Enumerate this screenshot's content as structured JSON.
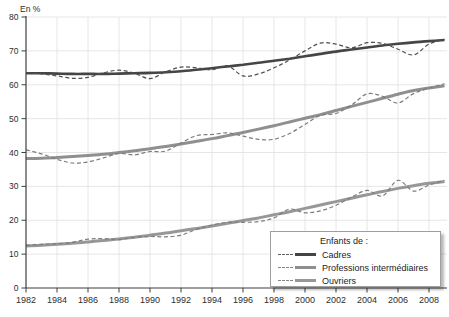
{
  "chart_data": {
    "type": "line",
    "title_partial": "selon le milieu social.",
    "unit_label": "En %",
    "xlabel": "",
    "ylabel": "En %",
    "xlim": [
      1982,
      2009
    ],
    "ylim": [
      0,
      80
    ],
    "ytick_step": 10,
    "xticks": [
      1982,
      1984,
      1986,
      1988,
      1990,
      1992,
      1994,
      1996,
      1998,
      2000,
      2002,
      2004,
      2006,
      2008
    ],
    "grid": true,
    "legend_position": "bottom-right",
    "years": [
      1982,
      1983,
      1984,
      1985,
      1986,
      1987,
      1988,
      1989,
      1990,
      1991,
      1992,
      1993,
      1994,
      1995,
      1996,
      1997,
      1998,
      1999,
      2000,
      2001,
      2002,
      2003,
      2004,
      2005,
      2006,
      2007,
      2008,
      2009
    ],
    "series": [
      {
        "name": "Cadres (courbe lissée)",
        "key": "cadres-trend",
        "style": "solid",
        "color": "#454545",
        "stroke_width": 2.6,
        "values": [
          63.4,
          63.4,
          63.3,
          63.2,
          63.2,
          63.2,
          63.3,
          63.4,
          63.5,
          63.7,
          64.0,
          64.4,
          64.9,
          65.4,
          65.9,
          66.5,
          67.1,
          67.7,
          68.4,
          69.1,
          69.8,
          70.4,
          71.0,
          71.6,
          72.1,
          72.5,
          72.9,
          73.2
        ]
      },
      {
        "name": "Cadres (série annuelle)",
        "key": "cadres-observed",
        "style": "dashed",
        "color": "#4e4e4e",
        "stroke_width": 1.2,
        "values": [
          63.5,
          63.2,
          62.6,
          61.9,
          62.2,
          63.5,
          64.3,
          63.4,
          61.8,
          63.8,
          65.2,
          65.0,
          64.4,
          65.6,
          62.6,
          63.2,
          65.0,
          67.3,
          70.0,
          72.3,
          72.0,
          70.9,
          72.4,
          72.2,
          70.5,
          68.8,
          72.0,
          73.4
        ]
      },
      {
        "name": "Professions intermédiaires (courbe lissée)",
        "key": "professions-trend",
        "style": "solid",
        "color": "#8f8f8f",
        "stroke_width": 3,
        "values": [
          38.2,
          38.3,
          38.5,
          38.8,
          39.1,
          39.5,
          40.0,
          40.5,
          41.1,
          41.8,
          42.5,
          43.3,
          44.1,
          45.0,
          45.9,
          46.9,
          47.9,
          49.0,
          50.1,
          51.2,
          52.4,
          53.6,
          54.8,
          56.0,
          57.2,
          58.3,
          59.0,
          59.7
        ]
      },
      {
        "name": "Professions intermédiaires (série annuelle)",
        "key": "professions-observed",
        "style": "dashed",
        "color": "#7c7c7c",
        "stroke_width": 1.2,
        "values": [
          40.8,
          39.6,
          38.0,
          36.9,
          37.2,
          38.4,
          39.7,
          39.3,
          40.3,
          40.4,
          42.8,
          45.0,
          45.3,
          45.8,
          44.8,
          43.9,
          43.9,
          45.6,
          48.3,
          51.0,
          51.5,
          54.0,
          57.3,
          56.6,
          54.6,
          57.4,
          59.0,
          60.3
        ]
      },
      {
        "name": "Ouvriers (courbe lissée)",
        "key": "ouvriers-trend",
        "style": "solid",
        "color": "#979797",
        "stroke_width": 3,
        "values": [
          12.4,
          12.6,
          12.9,
          13.2,
          13.6,
          14.0,
          14.5,
          15.0,
          15.6,
          16.2,
          16.9,
          17.6,
          18.3,
          19.1,
          19.9,
          20.7,
          21.6,
          22.5,
          23.5,
          24.5,
          25.5,
          26.5,
          27.5,
          28.5,
          29.4,
          30.2,
          30.9,
          31.4
        ]
      },
      {
        "name": "Ouvriers (série annuelle)",
        "key": "ouvriers-observed",
        "style": "dashed",
        "color": "#7c7c7c",
        "stroke_width": 1.2,
        "values": [
          12.6,
          12.9,
          13.1,
          13.5,
          14.4,
          14.6,
          14.3,
          14.9,
          15.2,
          15.1,
          15.6,
          17.3,
          18.6,
          19.4,
          19.4,
          19.6,
          20.7,
          23.3,
          22.2,
          22.8,
          24.4,
          26.8,
          28.8,
          27.2,
          31.8,
          28.6,
          30.4,
          31.8
        ]
      }
    ],
    "legend": {
      "title": "Enfants de :",
      "entries": [
        {
          "label": "Cadres",
          "solid_color": "#454545",
          "dash_color": "#5f5f5f"
        },
        {
          "label": "Professions intermédiaires",
          "solid_color": "#8f8f8f",
          "dash_color": "#848484"
        },
        {
          "label": "Ouvriers",
          "solid_color": "#979797",
          "dash_color": "#848484"
        }
      ]
    },
    "axis_colors": {
      "grid": "#e3e3e5",
      "axis": "#3f3f3f",
      "tick_text": "#2d2d2d"
    }
  }
}
